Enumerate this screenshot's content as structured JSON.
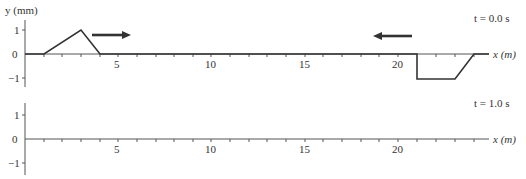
{
  "figure": {
    "y_axis_label": "y (mm)",
    "x_axis_label": "x (m)",
    "y_ticks": [
      "1",
      "0",
      "−1"
    ],
    "x_tick_labels": [
      "5",
      "10",
      "15",
      "20"
    ],
    "panels": [
      {
        "time_label": "t = 0.0 s",
        "pulses": [
          {
            "shape": "triangle",
            "direction": "right",
            "x_start_m": 1,
            "x_peak_m": 3,
            "x_end_m": 4,
            "amplitude_mm": 1
          },
          {
            "shape": "trapezoid",
            "direction": "left",
            "x_start_m": 21,
            "x_flat_end_m": 23,
            "x_end_m": 24,
            "amplitude_mm": -1
          }
        ],
        "arrows": [
          {
            "direction": "right-arrow-icon"
          },
          {
            "direction": "left-arrow-icon"
          }
        ]
      },
      {
        "time_label": "t = 1.0 s",
        "pulses": []
      }
    ],
    "x_range_m": [
      0,
      25
    ],
    "y_range_mm": [
      -1,
      1
    ]
  }
}
